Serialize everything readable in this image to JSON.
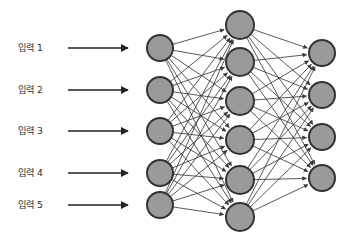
{
  "figure": {
    "title": "",
    "background_color": "#ffffff",
    "node_fill": "#9a9a9a",
    "node_stroke": "#333333",
    "edge_color": "#3b3b3b",
    "label_color": "#2b2b2b",
    "arrow_color": "#222222"
  },
  "inputs": [
    {
      "label": "입력 1",
      "label_x": 18,
      "label_y": 48,
      "arrow_x1": 68,
      "arrow_x2": 128,
      "arrow_y": 48
    },
    {
      "label": "입력 2",
      "label_x": 18,
      "label_y": 90,
      "arrow_x1": 68,
      "arrow_x2": 128,
      "arrow_y": 90
    },
    {
      "label": "입력 3",
      "label_x": 18,
      "label_y": 131,
      "arrow_x1": 68,
      "arrow_x2": 128,
      "arrow_y": 131
    },
    {
      "label": "입력 4",
      "label_x": 18,
      "label_y": 173,
      "arrow_x1": 68,
      "arrow_x2": 128,
      "arrow_y": 173
    },
    {
      "label": "입력 5",
      "label_x": 18,
      "label_y": 205,
      "arrow_x1": 68,
      "arrow_x2": 128,
      "arrow_y": 205
    }
  ],
  "layers": [
    {
      "name": "input-layer",
      "x": 160,
      "radius": 13,
      "nodes": [
        {
          "y": 48
        },
        {
          "y": 90
        },
        {
          "y": 131
        },
        {
          "y": 173
        },
        {
          "y": 205
        }
      ]
    },
    {
      "name": "hidden-layer",
      "x": 240,
      "radius": 14,
      "nodes": [
        {
          "y": 25
        },
        {
          "y": 62
        },
        {
          "y": 101
        },
        {
          "y": 140
        },
        {
          "y": 180
        },
        {
          "y": 217
        }
      ]
    },
    {
      "name": "output-layer",
      "x": 322,
      "radius": 13,
      "nodes": [
        {
          "y": 53
        },
        {
          "y": 95
        },
        {
          "y": 137
        },
        {
          "y": 178
        }
      ]
    }
  ],
  "connections": [
    {
      "from_layer": 0,
      "to_layer": 1,
      "fully_connected": true
    },
    {
      "from_layer": 1,
      "to_layer": 2,
      "fully_connected": true
    }
  ]
}
